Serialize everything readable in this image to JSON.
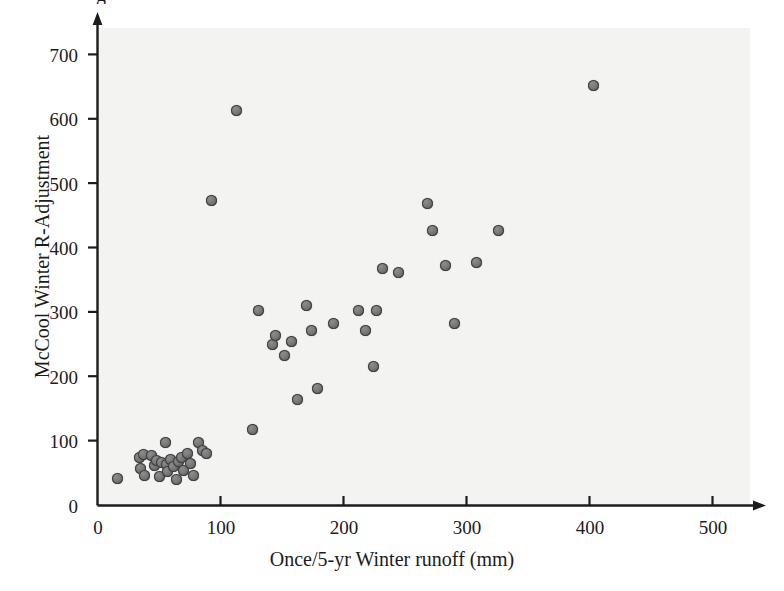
{
  "figure": {
    "background_color": "#ffffff",
    "plot_area_color": "#f3f3f2",
    "marker_color": "#6f6f6f",
    "marker_edge_color": "#3e3e3e",
    "axis_color": "#1c1c1c",
    "partial_top_text": "g"
  },
  "chart_data": {
    "type": "scatter",
    "title": "",
    "xlabel": "Once/5-yr Winter runoff (mm)",
    "ylabel": "McCool Winter R-Adjustment",
    "xlim": [
      0,
      520
    ],
    "ylim": [
      0,
      740
    ],
    "xticks": [
      0,
      100,
      200,
      300,
      400,
      500
    ],
    "yticks": [
      0,
      100,
      200,
      300,
      400,
      500,
      600,
      700
    ],
    "xtick_labels": [
      "0",
      "100",
      "200",
      "300",
      "400",
      "500"
    ],
    "ytick_labels": [
      "0",
      "100",
      "200",
      "300",
      "400",
      "500",
      "600",
      "700"
    ],
    "grid": false,
    "legend": "none",
    "series": [
      {
        "name": "observations",
        "marker": "circle",
        "points": [
          [
            16,
            42
          ],
          [
            34,
            74
          ],
          [
            35,
            58
          ],
          [
            37,
            79
          ],
          [
            38,
            47
          ],
          [
            44,
            77
          ],
          [
            46,
            62
          ],
          [
            48,
            70
          ],
          [
            50,
            45
          ],
          [
            52,
            66
          ],
          [
            55,
            97
          ],
          [
            56,
            64
          ],
          [
            57,
            53
          ],
          [
            59,
            72
          ],
          [
            62,
            60
          ],
          [
            64,
            40
          ],
          [
            66,
            68
          ],
          [
            68,
            74
          ],
          [
            70,
            55
          ],
          [
            73,
            80
          ],
          [
            76,
            65
          ],
          [
            78,
            47
          ],
          [
            82,
            98
          ],
          [
            85,
            86
          ],
          [
            89,
            80
          ],
          [
            93,
            474
          ],
          [
            113,
            613
          ],
          [
            126,
            118
          ],
          [
            131,
            302
          ],
          [
            142,
            250
          ],
          [
            145,
            264
          ],
          [
            152,
            233
          ],
          [
            158,
            254
          ],
          [
            163,
            164
          ],
          [
            170,
            310
          ],
          [
            174,
            272
          ],
          [
            179,
            182
          ],
          [
            192,
            283
          ],
          [
            212,
            302
          ],
          [
            218,
            272
          ],
          [
            224,
            216
          ],
          [
            227,
            302
          ],
          [
            232,
            367
          ],
          [
            245,
            362
          ],
          [
            268,
            469
          ],
          [
            272,
            427
          ],
          [
            283,
            373
          ],
          [
            290,
            283
          ],
          [
            308,
            377
          ],
          [
            326,
            426
          ],
          [
            403,
            652
          ]
        ]
      }
    ]
  }
}
